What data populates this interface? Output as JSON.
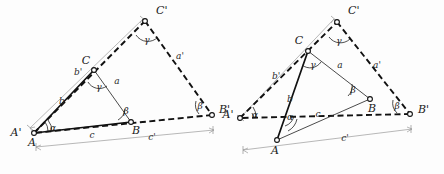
{
  "figure": {
    "background_color": "#fdfdfd",
    "ink_color": "#111111",
    "dimension_color": "#9a9a9a"
  },
  "left_diagram": {
    "name": "left-similar-triangles",
    "description": "Small triangle ABC nested inside larger similar triangle A'B'C' sharing vertex A",
    "vertices": [
      {
        "key": "A",
        "label": "A",
        "x": 34,
        "y": 133
      },
      {
        "key": "Aprime",
        "label": "A'",
        "x": 30,
        "y": 128
      },
      {
        "key": "B",
        "label": "B",
        "x": 131,
        "y": 122
      },
      {
        "key": "Bprime",
        "label": "B'",
        "x": 212,
        "y": 115
      },
      {
        "key": "C",
        "label": "C",
        "x": 94,
        "y": 70
      },
      {
        "key": "Cprime",
        "label": "C'",
        "x": 145,
        "y": 21
      }
    ],
    "side_labels": [
      {
        "key": "a",
        "label": "a",
        "x": 117,
        "y": 84
      },
      {
        "key": "b",
        "label": "b",
        "x": 62,
        "y": 104
      },
      {
        "key": "c",
        "label": "c",
        "x": 92,
        "y": 138
      },
      {
        "key": "ap",
        "label": "a'",
        "x": 180,
        "y": 59
      },
      {
        "key": "bp",
        "label": "b'",
        "x": 78,
        "y": 75
      },
      {
        "key": "cp",
        "label": "c'",
        "x": 152,
        "y": 140
      }
    ],
    "angle_labels": [
      {
        "key": "alpha-A",
        "label": "α",
        "x": 53,
        "y": 129
      },
      {
        "key": "beta-B",
        "label": "β",
        "x": 126,
        "y": 112
      },
      {
        "key": "gamma-C",
        "label": "γ",
        "x": 100,
        "y": 88
      },
      {
        "key": "gamma-Cprime",
        "label": "γ",
        "x": 148,
        "y": 40
      },
      {
        "key": "beta-Bprime",
        "label": "β",
        "x": 199,
        "y": 106
      }
    ]
  },
  "right_diagram": {
    "name": "right-similar-triangles",
    "description": "Triangle ABC overlapping larger similar triangle A'B'C' with shifted vertex A",
    "vertices": [
      {
        "key": "A",
        "label": "A",
        "x": 277,
        "y": 140
      },
      {
        "key": "Aprime",
        "label": "A'",
        "x": 240,
        "y": 118
      },
      {
        "key": "B",
        "label": "B",
        "x": 370,
        "y": 99
      },
      {
        "key": "Bprime",
        "label": "B'",
        "x": 410,
        "y": 114
      },
      {
        "key": "C",
        "label": "C",
        "x": 308,
        "y": 51
      },
      {
        "key": "Cprime",
        "label": "C'",
        "x": 337,
        "y": 22
      }
    ],
    "side_labels": [
      {
        "key": "a",
        "label": "a",
        "x": 340,
        "y": 68
      },
      {
        "key": "b",
        "label": "b",
        "x": 290,
        "y": 102
      },
      {
        "key": "c",
        "label": "c",
        "x": 318,
        "y": 117
      },
      {
        "key": "ap",
        "label": "a'",
        "x": 377,
        "y": 68
      },
      {
        "key": "bp",
        "label": "b'",
        "x": 276,
        "y": 79
      },
      {
        "key": "cp",
        "label": "c'",
        "x": 345,
        "y": 141
      }
    ],
    "angle_labels": [
      {
        "key": "alpha-Aprime",
        "label": "α",
        "x": 256,
        "y": 115
      },
      {
        "key": "alpha-A",
        "label": "α",
        "x": 290,
        "y": 116
      },
      {
        "key": "beta-B",
        "label": "β",
        "x": 355,
        "y": 90
      },
      {
        "key": "gamma-C",
        "label": "γ",
        "x": 315,
        "y": 66
      },
      {
        "key": "gamma-Cprime",
        "label": "γ",
        "x": 340,
        "y": 41
      },
      {
        "key": "beta-Bprime",
        "label": "β",
        "x": 396,
        "y": 106
      }
    ]
  }
}
